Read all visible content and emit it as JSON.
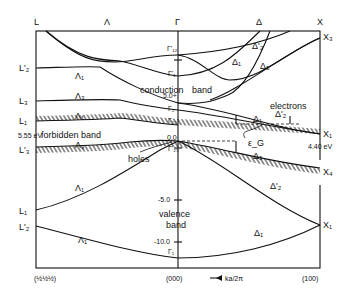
{
  "diagram": {
    "type": "band-structure",
    "top_labels": {
      "L": "L",
      "Lambda": "Λ",
      "Gamma": "Γ",
      "Delta": "Δ",
      "X": "X"
    },
    "left_labels": [
      "L'₂",
      "L₃",
      "L₁",
      "L'₃",
      "L₁",
      "L'₂"
    ],
    "right_labels": [
      "X₃",
      "X₁",
      "X₄",
      "X₁"
    ],
    "gamma_labels": [
      "Γ'₁₂",
      "Γ'₁",
      "Γ₂",
      "Γ₁₅",
      "Γ'₂₅",
      "Γ₁"
    ],
    "branch_labels": {
      "lambda": [
        "Λ₁",
        "Λ₃",
        "Λ₁",
        "Λ₃",
        "Λ₁",
        "Λ₁"
      ],
      "delta": [
        "Δ'₂",
        "Δ₁",
        "Δ₅",
        "Δ₁",
        "Δ'₂",
        "Δ₅",
        "Δ'₂",
        "Δ₁"
      ]
    },
    "region_labels": {
      "conduction": "conduction",
      "band": "band",
      "forbidden": "forbidden band",
      "valence": "valence",
      "valence_band": "band",
      "holes": "holes",
      "electrons": "electrons",
      "gap": "ε_G"
    },
    "energy_ticks": [
      "5.0+",
      "0.0",
      "-5.0",
      "-10.0"
    ],
    "annotations": {
      "L_gap": "5.55 eV",
      "X_gap": "4.40 eV"
    },
    "bottom_labels": {
      "left": "(½½½)",
      "center": "(000)",
      "arrow": "ka/2π",
      "right": "(100)"
    }
  }
}
